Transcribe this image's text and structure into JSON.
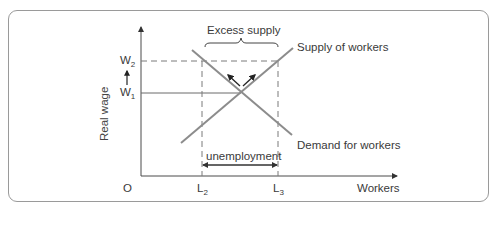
{
  "diagram": {
    "type": "labour-market-supply-demand",
    "axes": {
      "x_label": "Workers",
      "y_label": "Real wage",
      "origin_label": "O"
    },
    "y_ticks": {
      "w2": {
        "main": "W",
        "sub": "2"
      },
      "w1": {
        "main": "W",
        "sub": "1"
      }
    },
    "x_ticks": {
      "l2": {
        "main": "L",
        "sub": "2"
      },
      "l3": {
        "main": "L",
        "sub": "3"
      }
    },
    "curves": {
      "supply": "Supply of workers",
      "demand": "Demand for workers"
    },
    "annotations": {
      "excess_supply": "Excess supply",
      "unemployment": "unemployment"
    },
    "colors": {
      "curve": "#8c8c8c",
      "axis": "#4a4a4a",
      "dashed": "#7a7a7a",
      "frame": "#9a9a9a"
    }
  }
}
